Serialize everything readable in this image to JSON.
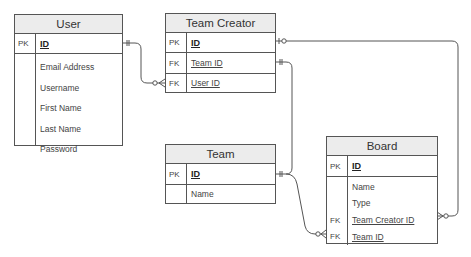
{
  "entities": {
    "user": {
      "title": "User",
      "pk": {
        "key": "PK",
        "name": "ID"
      },
      "attributes": [
        "Email Address",
        "Username",
        "First Name",
        "Last Name",
        "Password"
      ]
    },
    "team_creator": {
      "title": "Team Creator",
      "pk": {
        "key": "PK",
        "name": "ID"
      },
      "fks": [
        {
          "key": "FK",
          "name": "Team ID"
        },
        {
          "key": "FK",
          "name": "User ID"
        }
      ]
    },
    "team": {
      "title": "Team",
      "pk": {
        "key": "PK",
        "name": "ID"
      },
      "attributes": [
        "Name"
      ]
    },
    "board": {
      "title": "Board",
      "pk": {
        "key": "PK",
        "name": "ID"
      },
      "attributes": [
        "Name",
        "Type"
      ],
      "fks": [
        {
          "key": "FK",
          "name": "Team Creator ID"
        },
        {
          "key": "FK",
          "name": "Team ID"
        }
      ]
    }
  },
  "relationships": [
    {
      "from": "User.ID",
      "to": "Team Creator.User ID",
      "from_cardinality": "one-and-only-one",
      "to_cardinality": "zero-or-many"
    },
    {
      "from": "Team Creator.ID",
      "to": "Board.Team Creator ID",
      "from_cardinality": "zero-or-one",
      "to_cardinality": "zero-or-many"
    },
    {
      "from": "Team.ID",
      "to": "Team Creator.Team ID",
      "from_cardinality": "one-and-only-one",
      "to_cardinality": "one-and-only-one"
    },
    {
      "from": "Team.ID",
      "to": "Board.Team ID",
      "from_cardinality": "one-and-only-one",
      "to_cardinality": "zero-or-many"
    }
  ]
}
